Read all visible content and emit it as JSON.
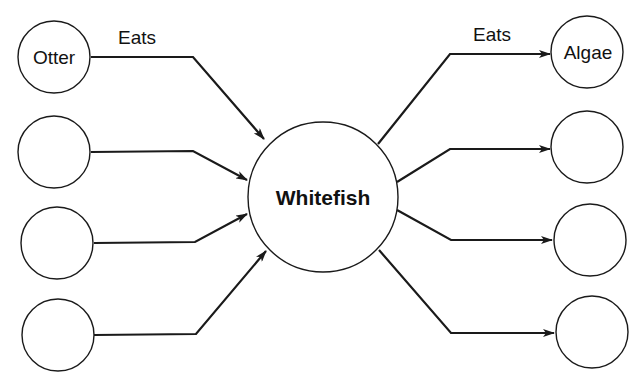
{
  "diagram": {
    "center": {
      "label": "Whitefish"
    },
    "left_nodes": [
      {
        "label": "Otter"
      },
      {
        "label": ""
      },
      {
        "label": ""
      },
      {
        "label": ""
      }
    ],
    "right_nodes": [
      {
        "label": "Algae"
      },
      {
        "label": ""
      },
      {
        "label": ""
      },
      {
        "label": ""
      }
    ],
    "edge_labels": {
      "left": "Eats",
      "right": "Eats"
    },
    "colors": {
      "stroke": "#1a1a1a",
      "background": "#ffffff"
    }
  }
}
